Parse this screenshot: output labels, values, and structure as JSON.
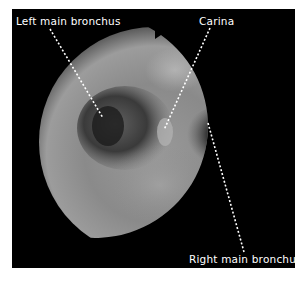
{
  "figure": {
    "type": "bronchoscopy-image",
    "background_color": "#000000",
    "annotation_color": "#ffffff",
    "labels": [
      {
        "id": "left-main-bronchus",
        "text": "Left main bronchus"
      },
      {
        "id": "carina",
        "text": "Carina"
      },
      {
        "id": "right-main-bronchus",
        "text": "Right main bronchus"
      }
    ]
  }
}
